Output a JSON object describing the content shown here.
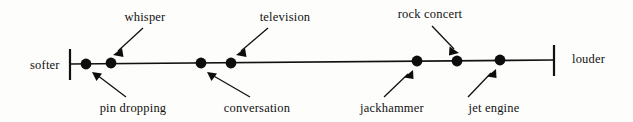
{
  "figure": {
    "kind": "number-line-diagram",
    "background_color": "#fdfdfb",
    "ink_color": "#111111",
    "axis": {
      "left_end_label": "softer",
      "right_end_label": "louder",
      "left_tick_x": 70,
      "right_tick_x": 554,
      "line_y_left": 64,
      "line_y_right": 60
    },
    "items": [
      {
        "label": "pin dropping",
        "side": "below",
        "dot_x": 86,
        "dot_y": 64,
        "dot_r": 5.4,
        "label_x": 133,
        "label_y": 112,
        "arrow_from_x": 126,
        "arrow_from_y": 97,
        "arrow_to_x": 92,
        "arrow_to_y": 72
      },
      {
        "label": "whisper",
        "side": "above",
        "dot_x": 111,
        "dot_y": 63,
        "dot_r": 5.4,
        "label_x": 145,
        "label_y": 21,
        "arrow_from_x": 143,
        "arrow_from_y": 28,
        "arrow_to_x": 113,
        "arrow_to_y": 55
      },
      {
        "label": "conversation",
        "side": "below",
        "dot_x": 201,
        "dot_y": 63,
        "dot_r": 5.4,
        "label_x": 257,
        "label_y": 112,
        "arrow_from_x": 250,
        "arrow_from_y": 97,
        "arrow_to_x": 207,
        "arrow_to_y": 72
      },
      {
        "label": "television",
        "side": "above",
        "dot_x": 231,
        "dot_y": 63,
        "dot_r": 5.4,
        "label_x": 285,
        "label_y": 21,
        "arrow_from_x": 268,
        "arrow_from_y": 28,
        "arrow_to_x": 236,
        "arrow_to_y": 55
      },
      {
        "label": "jackhammer",
        "side": "below",
        "dot_x": 417,
        "dot_y": 61,
        "dot_r": 5.4,
        "label_x": 392,
        "label_y": 112,
        "arrow_from_x": 384,
        "arrow_from_y": 97,
        "arrow_to_x": 413,
        "arrow_to_y": 70
      },
      {
        "label": "rock concert",
        "side": "above",
        "dot_x": 457,
        "dot_y": 61,
        "dot_r": 5.4,
        "label_x": 430,
        "label_y": 18,
        "arrow_from_x": 432,
        "arrow_from_y": 26,
        "arrow_to_x": 459,
        "arrow_to_y": 53
      },
      {
        "label": "jet engine",
        "side": "below",
        "dot_x": 500,
        "dot_y": 60,
        "dot_r": 5.4,
        "label_x": 494,
        "label_y": 112,
        "arrow_from_x": 468,
        "arrow_from_y": 97,
        "arrow_to_x": 496,
        "arrow_to_y": 69
      }
    ]
  }
}
